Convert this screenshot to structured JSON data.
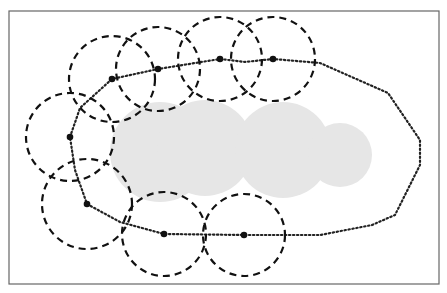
{
  "figure": {
    "frame": {
      "x": 9,
      "y": 11,
      "width": 430,
      "height": 273,
      "stroke": "#666666"
    },
    "colors": {
      "region_fill": "#e6e6e6",
      "dashed_circle": "#111111",
      "path": "#222222",
      "sensor_node": "#111111"
    },
    "region_circles": [
      {
        "cx": 160,
        "cy": 152,
        "r": 50
      },
      {
        "cx": 205,
        "cy": 148,
        "r": 48
      },
      {
        "cx": 283,
        "cy": 150,
        "r": 48
      },
      {
        "cx": 340,
        "cy": 155,
        "r": 32
      }
    ],
    "sensor_nodes": [
      {
        "cx": 70,
        "cy": 137,
        "range": 44
      },
      {
        "cx": 112,
        "cy": 79,
        "range": 43
      },
      {
        "cx": 158,
        "cy": 69,
        "range": 42
      },
      {
        "cx": 220,
        "cy": 59,
        "range": 42
      },
      {
        "cx": 273,
        "cy": 59,
        "range": 42
      },
      {
        "cx": 87,
        "cy": 204,
        "range": 45
      },
      {
        "cx": 164,
        "cy": 234,
        "range": 42
      },
      {
        "cx": 244,
        "cy": 235,
        "range": 41
      }
    ],
    "boundary_path": [
      [
        70,
        137
      ],
      [
        80,
        108
      ],
      [
        112,
        79
      ],
      [
        158,
        69
      ],
      [
        220,
        59
      ],
      [
        245,
        62
      ],
      [
        273,
        59
      ],
      [
        320,
        63
      ],
      [
        388,
        93
      ],
      [
        420,
        140
      ],
      [
        420,
        165
      ],
      [
        395,
        215
      ],
      [
        372,
        225
      ],
      [
        320,
        235
      ],
      [
        244,
        235
      ],
      [
        164,
        234
      ],
      [
        120,
        222
      ],
      [
        87,
        204
      ],
      [
        75,
        170
      ],
      [
        70,
        137
      ]
    ],
    "caption": ""
  }
}
